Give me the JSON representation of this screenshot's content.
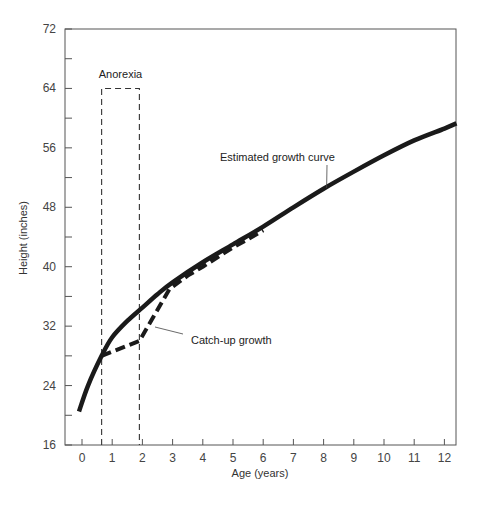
{
  "chart_data": {
    "type": "line",
    "title": "",
    "xlabel": "Age (years)",
    "ylabel": "Height (inches)",
    "xlim": [
      -0.55,
      12.4
    ],
    "ylim": [
      16,
      72
    ],
    "x_ticks": [
      0,
      1,
      2,
      3,
      4,
      5,
      6,
      7,
      8,
      9,
      10,
      11,
      12
    ],
    "y_ticks_labeled": [
      16,
      24,
      32,
      40,
      48,
      56,
      64,
      72
    ],
    "y_minor_ticks": [
      20,
      28,
      36,
      44,
      52,
      60,
      68
    ],
    "grid": false,
    "legend": null,
    "series": [
      {
        "name": "Estimated growth curve",
        "style": "solid-thick",
        "color": "#1a1a1a",
        "points": [
          [
            -0.1,
            20.5
          ],
          [
            0.2,
            24
          ],
          [
            0.65,
            28
          ],
          [
            1.0,
            30.5
          ],
          [
            1.5,
            32.7
          ],
          [
            2.0,
            34.5
          ],
          [
            2.5,
            36.3
          ],
          [
            3.0,
            37.9
          ],
          [
            4.0,
            40.6
          ],
          [
            5.0,
            43.0
          ],
          [
            6.0,
            45.4
          ],
          [
            7.0,
            48.0
          ],
          [
            8.0,
            50.5
          ],
          [
            9.0,
            52.8
          ],
          [
            10.0,
            55.0
          ],
          [
            11.0,
            57.0
          ],
          [
            12.0,
            58.6
          ],
          [
            12.4,
            59.3
          ]
        ]
      },
      {
        "name": "Catch-up growth",
        "style": "dashed-thick",
        "color": "#1a1a1a",
        "points": [
          [
            0.65,
            28
          ],
          [
            1.9,
            30
          ],
          [
            2.9,
            37
          ],
          [
            3.5,
            38.8
          ],
          [
            4.0,
            40.0
          ],
          [
            4.5,
            41.3
          ],
          [
            5.0,
            42.6
          ],
          [
            5.5,
            43.7
          ],
          [
            6.0,
            44.9
          ]
        ]
      }
    ],
    "annotations": [
      {
        "text": "Anorexia",
        "type": "dashed-box",
        "x_range": [
          0.65,
          1.9
        ],
        "y_range": [
          16,
          64
        ]
      },
      {
        "text": "Estimated growth curve",
        "points_to": [
          8.1,
          50.6
        ]
      },
      {
        "text": "Catch-up growth",
        "points_to": [
          2.4,
          33.5
        ]
      }
    ]
  }
}
